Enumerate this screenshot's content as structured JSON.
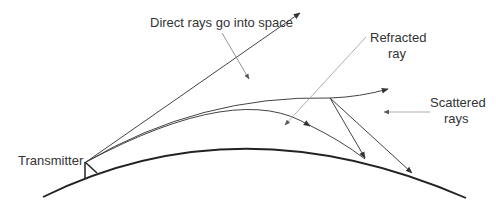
{
  "diagram": {
    "labels": {
      "direct": "Direct rays go into space",
      "refracted_line1": "Refracted",
      "refracted_line2": "ray",
      "scattered_line1": "Scattered",
      "scattered_line2": "rays",
      "transmitter": "Transmitter"
    },
    "colors": {
      "ray": "#444444",
      "earth": "#222222",
      "pointer": "#9a9a9a",
      "text": "#333333"
    }
  }
}
